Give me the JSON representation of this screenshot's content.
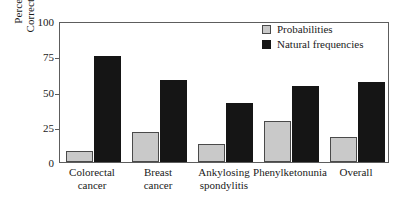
{
  "chart_data": {
    "type": "bar",
    "title": "",
    "xlabel": "",
    "ylabel": "Percentage of Correct Inference",
    "ylabel_lines": [
      "Percentage of",
      "Correct Inference"
    ],
    "ylim": [
      0,
      100
    ],
    "yticks": [
      0,
      25,
      50,
      75,
      100
    ],
    "ytick_labels": [
      "0",
      "25",
      "50",
      "75",
      "100"
    ],
    "grid": false,
    "legend_position": "top-right",
    "categories": [
      "Colorectal cancer",
      "Breast cancer",
      "Ankylosing spondylitis",
      "Phenylketonunia",
      "Overall"
    ],
    "category_lines": [
      [
        "Colorectal",
        "cancer"
      ],
      [
        "Breast",
        "cancer"
      ],
      [
        "Ankylosing",
        "spondylitis"
      ],
      [
        "Phenylketonunia"
      ],
      [
        "Overall"
      ]
    ],
    "series": [
      {
        "name": "Probabilities",
        "color": "#c9c9c9",
        "values": [
          8,
          21,
          13,
          29,
          18
        ]
      },
      {
        "name": "Natural frequencies",
        "color": "#151515",
        "values": [
          75,
          58,
          42,
          54,
          57
        ]
      }
    ]
  },
  "legend": {
    "items": [
      {
        "label": "Probabilities",
        "swatch": "light-gray-square"
      },
      {
        "label": "Natural frequencies",
        "swatch": "black-square"
      }
    ]
  },
  "colors": {
    "probabilities": "#c9c9c9",
    "natural_frequencies": "#151515",
    "axis": "#5d5d5d",
    "text": "#1a1a1a",
    "background": "#ffffff"
  }
}
